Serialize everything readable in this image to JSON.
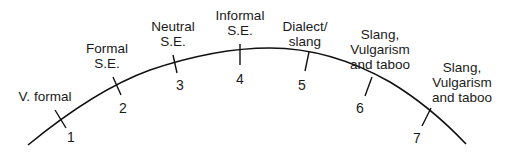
{
  "diagram": {
    "title": "",
    "points": [
      {
        "number": "1",
        "label_lines": [
          "V. formal"
        ]
      },
      {
        "number": "2",
        "label_lines": [
          "Formal",
          "S.E."
        ]
      },
      {
        "number": "3",
        "label_lines": [
          "Neutral",
          "S.E."
        ]
      },
      {
        "number": "4",
        "label_lines": [
          "Informal",
          "S.E."
        ]
      },
      {
        "number": "5",
        "label_lines": [
          "Dialect/",
          "slang"
        ]
      },
      {
        "number": "6",
        "label_lines": [
          "Slang,",
          "Vulgarism",
          "and taboo"
        ]
      },
      {
        "number": "7",
        "label_lines": [
          "Slang,",
          "Vulgarism",
          "and taboo"
        ]
      }
    ],
    "colors": {
      "line": "#111111",
      "text": "#1a1a1a",
      "background": "#ffffff"
    }
  }
}
